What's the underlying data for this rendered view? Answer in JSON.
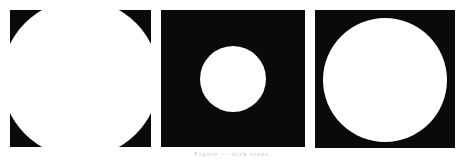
{
  "figure": {
    "panels": [
      {
        "label": "Large disk (clipped by frame)",
        "background": "#0a0a0a",
        "disk_color": "#ffffff"
      },
      {
        "label": "Small disk",
        "background": "#0a0a0a",
        "disk_color": "#ffffff"
      },
      {
        "label": "Medium disk",
        "background": "#0a0a0a",
        "disk_color": "#ffffff"
      }
    ],
    "caption": "Figure — disk sizes"
  }
}
